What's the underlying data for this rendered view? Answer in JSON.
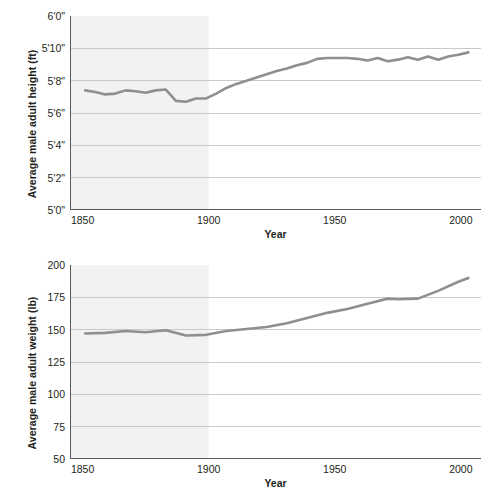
{
  "figure": {
    "background": "#ffffff",
    "line_color": "#8f8f8f",
    "grid_color": "#c9c9c9",
    "axis_color": "#58595b",
    "shaded_color": "#f2f2f2",
    "shaded_from": 1850,
    "shaded_to": 1900
  },
  "chart_data": [
    {
      "type": "line",
      "title": "",
      "xlabel": "Year",
      "ylabel": "Average male adult height (ft)",
      "xlim": [
        1845,
        2008
      ],
      "ylim": [
        60,
        72
      ],
      "grid": true,
      "legend": "none",
      "xticks": [
        1850,
        1900,
        1950,
        2000
      ],
      "xticklabels": [
        "1850",
        "1900",
        "1950",
        "2000"
      ],
      "yticks": [
        60,
        62,
        64,
        66,
        68,
        70,
        72
      ],
      "yticklabels": [
        "5'0\"",
        "5'2\"",
        "5'4\"",
        "5'6\"",
        "5'8\"",
        "5'10\"",
        "6'0\""
      ],
      "y_unit": "inches",
      "series": [
        {
          "name": "Average male adult height",
          "x": [
            1851,
            1855,
            1859,
            1863,
            1867,
            1871,
            1875,
            1879,
            1883,
            1887,
            1891,
            1895,
            1899,
            1903,
            1907,
            1911,
            1915,
            1919,
            1923,
            1927,
            1931,
            1935,
            1939,
            1943,
            1947,
            1951,
            1955,
            1959,
            1963,
            1967,
            1971,
            1975,
            1979,
            1983,
            1987,
            1991,
            1995,
            1999,
            2003
          ],
          "y": [
            67.4,
            67.3,
            67.15,
            67.2,
            67.4,
            67.35,
            67.25,
            67.4,
            67.45,
            66.75,
            66.7,
            66.9,
            66.9,
            67.2,
            67.55,
            67.8,
            68.0,
            68.2,
            68.4,
            68.6,
            68.75,
            68.95,
            69.1,
            69.35,
            69.4,
            69.4,
            69.4,
            69.35,
            69.25,
            69.4,
            69.2,
            69.3,
            69.45,
            69.3,
            69.5,
            69.3,
            69.5,
            69.6,
            69.75
          ]
        }
      ]
    },
    {
      "type": "line",
      "title": "",
      "xlabel": "Year",
      "ylabel": "Average male adult weight (lb)",
      "xlim": [
        1845,
        2008
      ],
      "ylim": [
        50,
        200
      ],
      "grid": true,
      "legend": "none",
      "xticks": [
        1850,
        1900,
        1950,
        2000
      ],
      "xticklabels": [
        "1850",
        "1900",
        "1950",
        "2000"
      ],
      "yticks": [
        50,
        75,
        100,
        125,
        150,
        175,
        200
      ],
      "yticklabels": [
        "50",
        "75",
        "100",
        "125",
        "150",
        "175",
        "200"
      ],
      "y_unit": "pounds",
      "series": [
        {
          "name": "Average male adult weight",
          "x": [
            1851,
            1859,
            1867,
            1875,
            1883,
            1891,
            1899,
            1907,
            1915,
            1923,
            1931,
            1939,
            1947,
            1955,
            1963,
            1971,
            1975,
            1983,
            1991,
            1999,
            2003
          ],
          "y": [
            147,
            147.5,
            149,
            148,
            149.5,
            145.5,
            146,
            149,
            150.5,
            152,
            155,
            159,
            163,
            166,
            170,
            174,
            173.5,
            174,
            180,
            187,
            190
          ]
        }
      ]
    }
  ]
}
